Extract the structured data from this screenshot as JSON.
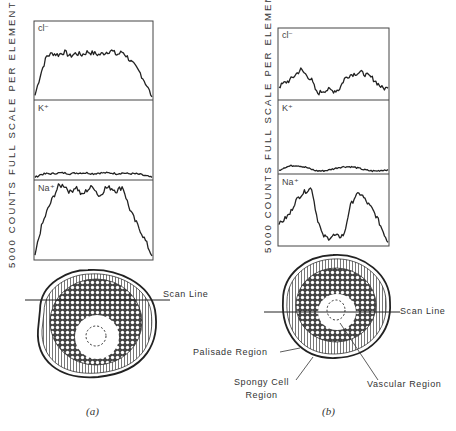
{
  "figure": {
    "y_axis_label": "5000 COUNTS FULL SCALE PER ELEMENT",
    "panels": [
      {
        "id": "a",
        "label": "(a)",
        "elements": [
          "cl⁻",
          "K⁺",
          "Na⁺"
        ],
        "scan_line_label": "Scan Line"
      },
      {
        "id": "b",
        "label": "(b)",
        "elements": [
          "cl⁻",
          "K⁺",
          "Na⁺"
        ],
        "scan_line_label": "Scan Line",
        "annotations": {
          "palisade": "Palisade Region",
          "spongy_line1": "Spongy Cell",
          "spongy_line2": "Region",
          "vascular": "Vascular Region"
        }
      }
    ]
  },
  "chart_data": [
    {
      "type": "line",
      "title": "(a) Element scan profiles",
      "ylabel": "5000 counts full scale per element",
      "xlabel": "Position along scan line",
      "x": [
        0,
        5,
        10,
        15,
        20,
        25,
        30,
        35,
        40,
        45,
        50,
        55,
        60,
        65,
        70,
        75,
        80,
        85,
        90,
        95,
        100
      ],
      "series": [
        {
          "name": "Cl-",
          "values": [
            5,
            35,
            58,
            62,
            60,
            64,
            58,
            62,
            60,
            64,
            62,
            60,
            63,
            66,
            60,
            64,
            55,
            45,
            35,
            20,
            3
          ]
        },
        {
          "name": "K+",
          "values": [
            2,
            6,
            7,
            7,
            8,
            8,
            7,
            8,
            8,
            8,
            7,
            8,
            8,
            8,
            7,
            8,
            7,
            7,
            6,
            4,
            2
          ]
        },
        {
          "name": "Na+",
          "values": [
            5,
            40,
            62,
            80,
            96,
            98,
            88,
            96,
            84,
            92,
            96,
            82,
            94,
            94,
            90,
            96,
            70,
            52,
            38,
            22,
            4
          ]
        }
      ],
      "ylim": [
        0,
        100
      ]
    },
    {
      "type": "line",
      "title": "(b) Element scan profiles",
      "ylabel": "5000 counts full scale per element",
      "xlabel": "Position along scan line",
      "x": [
        0,
        5,
        10,
        15,
        20,
        25,
        30,
        35,
        40,
        45,
        50,
        55,
        60,
        65,
        70,
        75,
        80,
        85,
        90,
        95,
        100
      ],
      "series": [
        {
          "name": "Cl-",
          "values": [
            18,
            24,
            28,
            36,
            44,
            36,
            28,
            8,
            12,
            14,
            12,
            14,
            30,
            36,
            38,
            40,
            36,
            32,
            24,
            16,
            16
          ]
        },
        {
          "name": "K+",
          "values": [
            4,
            8,
            10,
            11,
            10,
            8,
            5,
            3,
            3,
            4,
            6,
            8,
            9,
            9,
            8,
            6,
            4,
            3,
            3,
            4,
            5
          ]
        },
        {
          "name": "Na+",
          "values": [
            30,
            38,
            46,
            64,
            74,
            80,
            84,
            40,
            14,
            10,
            14,
            12,
            16,
            56,
            72,
            76,
            64,
            54,
            40,
            22,
            4
          ]
        }
      ],
      "ylim": [
        0,
        100
      ]
    }
  ]
}
